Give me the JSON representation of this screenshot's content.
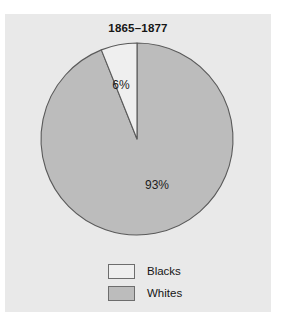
{
  "page": {
    "top_clipped_text": "",
    "background_color": "#ffffff",
    "panel_color": "#e9e9e9"
  },
  "chart_data": {
    "type": "pie",
    "title": "1865–1877",
    "subtitle": "",
    "xlabel": "",
    "ylabel": "",
    "legend_position": "bottom-center",
    "grid": false,
    "start_angle_deg": 0,
    "direction": "counterclockwise",
    "categories": [
      "Blacks",
      "Whites"
    ],
    "values": [
      6,
      93
    ],
    "value_suffix": "%",
    "slices": [
      {
        "label": "Blacks",
        "value": 6,
        "display": "6%",
        "color": "#efefef",
        "edge_color": "#5a5a5a",
        "label_x": 116,
        "label_y": 75
      },
      {
        "label": "Whites",
        "value": 93,
        "display": "93%",
        "color": "#bcbcbc",
        "edge_color": "#5a5a5a",
        "label_x": 152,
        "label_y": 175
      }
    ],
    "legend": [
      {
        "label": "Blacks",
        "color": "#efefef",
        "edge_color": "#6d6d6d"
      },
      {
        "label": "Whites",
        "color": "#bcbcbc",
        "edge_color": "#6d6d6d"
      }
    ],
    "geometry": {
      "center_x": 132,
      "center_y": 125,
      "radius": 96
    }
  }
}
